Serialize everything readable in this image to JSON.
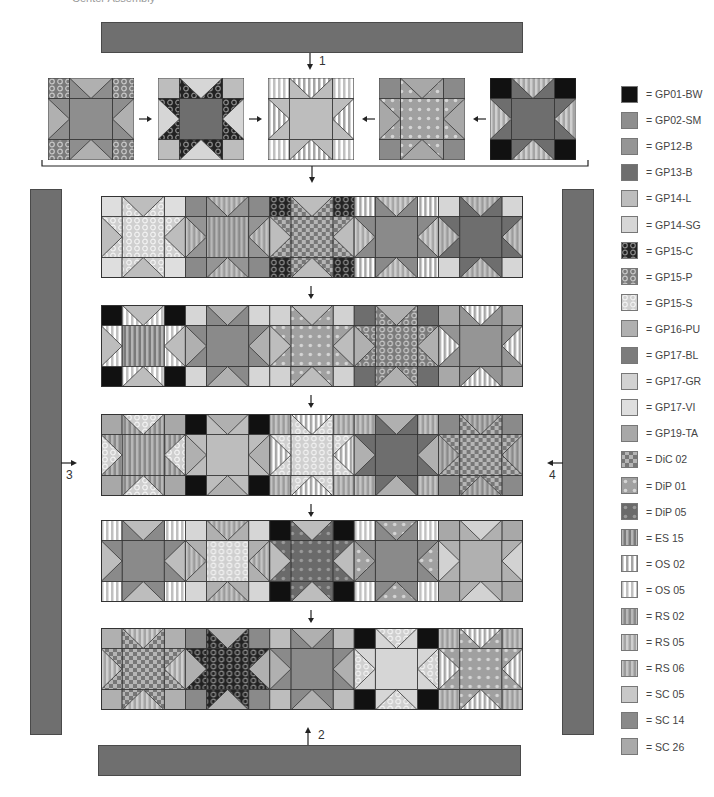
{
  "caption": "Center Assembly",
  "step_labels": {
    "s1": "1",
    "s2": "2",
    "s3": "3",
    "s4": "4"
  },
  "colors": {
    "border": "#6f6f6f",
    "outline": "#333333"
  },
  "fabrics": {
    "GP01-BW": {
      "base": "#111111",
      "pattern": "solid"
    },
    "GP02-SM": {
      "base": "#8e8e8e",
      "pattern": "solid"
    },
    "GP12-B": {
      "base": "#959595",
      "pattern": "solid"
    },
    "GP13-B": {
      "base": "#6e6e6e",
      "pattern": "solid"
    },
    "GP14-L": {
      "base": "#bdbdbd",
      "pattern": "solid"
    },
    "GP14-SG": {
      "base": "#d6d6d6",
      "pattern": "solid"
    },
    "GP15-C": {
      "base": "#222222",
      "pattern": "rings",
      "fg": "#8a8a8a"
    },
    "GP15-P": {
      "base": "#7a7a7a",
      "pattern": "rings",
      "fg": "#c8c8c8"
    },
    "GP15-S": {
      "base": "#cfcfcf",
      "pattern": "rings",
      "fg": "#f2f2f2"
    },
    "GP16-PU": {
      "base": "#b0b0b0",
      "pattern": "solid"
    },
    "GP17-BL": {
      "base": "#7c7c7c",
      "pattern": "solid"
    },
    "GP17-GR": {
      "base": "#d2d2d2",
      "pattern": "solid"
    },
    "GP17-VI": {
      "base": "#dedede",
      "pattern": "solid"
    },
    "GP19-TA": {
      "base": "#a8a8a8",
      "pattern": "solid"
    },
    "DiC 02": {
      "base": "#b5b5b5",
      "pattern": "checks",
      "fg": "#777777"
    },
    "DiP 01": {
      "base": "#a0a0a0",
      "pattern": "dots",
      "fg": "#d5d5d5"
    },
    "DiP 05": {
      "base": "#6a6a6a",
      "pattern": "dots",
      "fg": "#9a9a9a"
    },
    "ES 15": {
      "base": "#7a7a7a",
      "pattern": "vstripe",
      "fg": "#b5b5b5"
    },
    "OS 02": {
      "base": "#ffffff",
      "pattern": "vstripe",
      "fg": "#a5a5a5"
    },
    "OS 05": {
      "base": "#ffffff",
      "pattern": "vstripe",
      "fg": "#c0c0c0"
    },
    "RS 02": {
      "base": "#8a8a8a",
      "pattern": "vstripe",
      "fg": "#b8b8b8"
    },
    "RS 05": {
      "base": "#a5a5a5",
      "pattern": "vstripe",
      "fg": "#cfcfcf"
    },
    "RS 06": {
      "base": "#9b9b9b",
      "pattern": "vstripe",
      "fg": "#c5c5c5"
    },
    "SC 05": {
      "base": "#c8c8c8",
      "pattern": "solid"
    },
    "SC 14": {
      "base": "#8a8a8a",
      "pattern": "solid"
    },
    "SC 26": {
      "base": "#a9a9a9",
      "pattern": "solid"
    }
  },
  "legend": [
    {
      "code": "GP01-BW",
      "label": "= GP01-BW"
    },
    {
      "code": "GP02-SM",
      "label": "= GP02-SM"
    },
    {
      "code": "GP12-B",
      "label": "= GP12-B"
    },
    {
      "code": "GP13-B",
      "label": "= GP13-B"
    },
    {
      "code": "GP14-L",
      "label": "= GP14-L"
    },
    {
      "code": "GP14-SG",
      "label": "= GP14-SG"
    },
    {
      "code": "GP15-C",
      "label": "= GP15-C"
    },
    {
      "code": "GP15-P",
      "label": "= GP15-P"
    },
    {
      "code": "GP15-S",
      "label": "= GP15-S"
    },
    {
      "code": "GP16-PU",
      "label": "= GP16-PU"
    },
    {
      "code": "GP17-BL",
      "label": "= GP17-BL"
    },
    {
      "code": "GP17-GR",
      "label": "= GP17-GR"
    },
    {
      "code": "GP17-VI",
      "label": "= GP17-VI"
    },
    {
      "code": "GP19-TA",
      "label": "= GP19-TA"
    },
    {
      "code": "DiC 02",
      "label": "= DiC 02"
    },
    {
      "code": "DiP 01",
      "label": "= DiP 01"
    },
    {
      "code": "DiP 05",
      "label": "= DiP 05"
    },
    {
      "code": "ES 15",
      "label": "= ES 15"
    },
    {
      "code": "OS 02",
      "label": "= OS 02"
    },
    {
      "code": "OS 05",
      "label": "= OS 05"
    },
    {
      "code": "RS 02",
      "label": "= RS 02"
    },
    {
      "code": "RS 05",
      "label": "= RS 05"
    },
    {
      "code": "RS 06",
      "label": "= RS 06"
    },
    {
      "code": "SC 05",
      "label": "= SC 05"
    },
    {
      "code": "SC 14",
      "label": "= SC 14"
    },
    {
      "code": "SC 26",
      "label": "= SC 26"
    }
  ],
  "example_blocks": [
    {
      "corner": "GP15-P",
      "bg": "GP16-PU",
      "point": "GP02-SM",
      "center": "GP02-SM"
    },
    {
      "corner": "GP14-L",
      "bg": "GP14-SG",
      "point": "GP15-C",
      "center": "GP13-B"
    },
    {
      "corner": "OS 05",
      "bg": "OS 02",
      "point": "GP14-L",
      "center": "GP14-L"
    },
    {
      "corner": "SC 14",
      "bg": "GP19-TA",
      "point": "DiP 01",
      "center": "DiP 01"
    },
    {
      "corner": "GP01-BW",
      "bg": "RS 05",
      "point": "GP13-B",
      "center": "GP13-B"
    }
  ],
  "rows": [
    [
      {
        "corner": "GP17-VI",
        "bg": "GP14-L",
        "point": "GP15-S",
        "center": "GP15-S"
      },
      {
        "corner": "SC 14",
        "bg": "RS 06",
        "point": "GP12-B",
        "center": "RS 02"
      },
      {
        "corner": "GP15-C",
        "bg": "GP14-L",
        "point": "DiC 02",
        "center": "DiC 02"
      },
      {
        "corner": "OS 02",
        "bg": "RS 05",
        "point": "SC 14",
        "center": "SC 14"
      },
      {
        "corner": "GP14-SG",
        "bg": "RS 06",
        "point": "GP13-B",
        "center": "GP13-B"
      }
    ],
    [
      {
        "corner": "GP01-BW",
        "bg": "GP14-L",
        "point": "OS 05",
        "center": "ES 15"
      },
      {
        "corner": "GP14-SG",
        "bg": "GP16-PU",
        "point": "SC 14",
        "center": "SC 14"
      },
      {
        "corner": "GP17-GR",
        "bg": "GP14-L",
        "point": "DiP 01",
        "center": "DiP 01"
      },
      {
        "corner": "GP13-B",
        "bg": "GP16-PU",
        "point": "GP15-P",
        "center": "GP15-P"
      },
      {
        "corner": "GP19-TA",
        "bg": "OS 02",
        "point": "GP12-B",
        "center": "GP12-B"
      }
    ],
    [
      {
        "corner": "GP19-TA",
        "bg": "GP15-S",
        "point": "RS 02",
        "center": "RS 02"
      },
      {
        "corner": "GP01-BW",
        "bg": "GP16-PU",
        "point": "GP14-L",
        "center": "GP14-L"
      },
      {
        "corner": "RS 06",
        "bg": "OS 02",
        "point": "GP15-S",
        "center": "GP15-S"
      },
      {
        "corner": "RS 06",
        "bg": "GP16-PU",
        "point": "GP13-B",
        "center": "GP13-B"
      },
      {
        "corner": "SC 14",
        "bg": "RS 02",
        "point": "DiC 02",
        "center": "DiC 02"
      }
    ],
    [
      {
        "corner": "OS 05",
        "bg": "GP14-L",
        "point": "SC 14",
        "center": "SC 14"
      },
      {
        "corner": "GP14-SG",
        "bg": "RS 06",
        "point": "GP16-PU",
        "center": "GP15-S"
      },
      {
        "corner": "GP01-BW",
        "bg": "GP14-L",
        "point": "DiP 05",
        "center": "DiP 05"
      },
      {
        "corner": "OS 05",
        "bg": "DiP 01",
        "point": "SC 14",
        "center": "SC 14"
      },
      {
        "corner": "GP19-TA",
        "bg": "GP17-GR",
        "point": "GP16-PU",
        "center": "GP16-PU"
      }
    ],
    [
      {
        "corner": "GP16-PU",
        "bg": "RS 05",
        "point": "DiC 02",
        "center": "DiC 02"
      },
      {
        "corner": "SC 14",
        "bg": "GP16-PU",
        "point": "GP15-C",
        "center": "GP15-C"
      },
      {
        "corner": "GP14-L",
        "bg": "GP16-PU",
        "point": "SC 14",
        "center": "SC 14"
      },
      {
        "corner": "GP01-BW",
        "bg": "GP15-S",
        "point": "GP14-SG",
        "center": "GP14-SG"
      },
      {
        "corner": "RS 06",
        "bg": "OS 02",
        "point": "DiP 01",
        "center": "DiP 01"
      }
    ]
  ]
}
